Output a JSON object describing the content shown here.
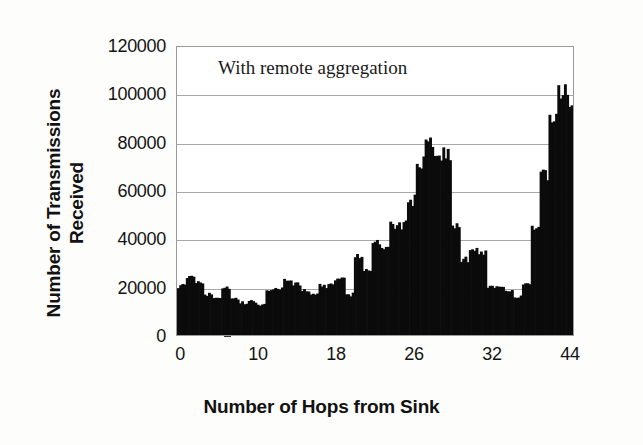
{
  "chart_data": {
    "type": "bar",
    "title": "",
    "annotation": "With remote aggregation",
    "xlabel": "Number of Hops from Sink",
    "ylabel_line1": "Number of Transmissions",
    "ylabel_line2": "Received",
    "grid": true,
    "legend": "none",
    "xlim": [
      0,
      44
    ],
    "ylim": [
      0,
      120000
    ],
    "ytick_labels": [
      "0",
      "20000",
      "40000",
      "60000",
      "80000",
      "100000",
      "120000"
    ],
    "ytick_values": [
      0,
      20000,
      40000,
      60000,
      80000,
      100000,
      120000
    ],
    "xtick_labels": [
      "0",
      "10",
      "18",
      "26",
      "32",
      "44"
    ],
    "xtick_values": [
      0,
      10,
      18,
      26,
      32,
      44
    ],
    "bar_color": "#0b0b0b",
    "axis_color": "#9a9a98",
    "grid_color": "#a8a8a6",
    "background_color": "#ffffff",
    "categories": [
      0,
      1,
      2,
      3,
      4,
      5,
      6,
      7,
      8,
      9,
      10,
      11,
      12,
      13,
      14,
      15,
      16,
      17,
      18,
      19,
      20,
      21,
      22,
      23,
      24,
      25,
      26,
      27,
      28,
      29,
      30,
      31,
      32,
      33,
      34,
      35,
      36,
      37,
      38,
      39,
      40,
      41,
      42,
      43,
      44
    ],
    "values": [
      21000,
      24500,
      23000,
      17500,
      16500,
      20500,
      15500,
      14000,
      14500,
      13500,
      19500,
      20000,
      23500,
      22000,
      19000,
      18000,
      21000,
      22500,
      23500,
      17500,
      33500,
      28000,
      38500,
      36500,
      45500,
      46000,
      56500,
      71500,
      81000,
      76000,
      75500,
      45000,
      32000,
      35500,
      35000,
      21000,
      20500,
      19500,
      16500,
      21500,
      45000,
      66500,
      88500,
      100000,
      96500
    ]
  }
}
